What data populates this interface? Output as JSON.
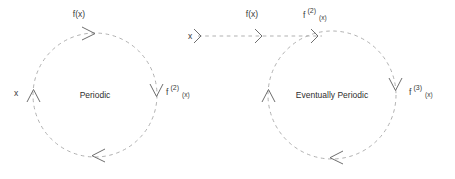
{
  "figure": {
    "type": "diagram",
    "background_color": "#ffffff",
    "stroke_color": "#a8a8a8",
    "text_color": "#3a3a3a",
    "line_style": "dashed",
    "arrow_style": "open-v"
  },
  "left_diagram": {
    "name": "periodic-orbit",
    "center_label": "Periodic",
    "cycle": {
      "center_x": 95,
      "center_y": 95,
      "radius": 62,
      "direction": "clockwise"
    },
    "labels": {
      "start": "x",
      "top": "f(x)",
      "right_base": "f",
      "right_sup": "(2)",
      "right_sub": "(x)"
    }
  },
  "right_diagram": {
    "name": "eventually-periodic-orbit",
    "center_label": "Eventually Periodic",
    "cycle": {
      "center_x": 332,
      "center_y": 95,
      "radius": 64,
      "direction": "clockwise"
    },
    "tail": {
      "start_x": 198,
      "end_x": 322,
      "y": 36
    },
    "labels": {
      "start": "x",
      "tail_mid": "f(x)",
      "entry_base": "f",
      "entry_sup": "(2)",
      "entry_sub": "(x)",
      "right_base": "f",
      "right_sup": "(3)",
      "right_sub": "(x)"
    }
  }
}
